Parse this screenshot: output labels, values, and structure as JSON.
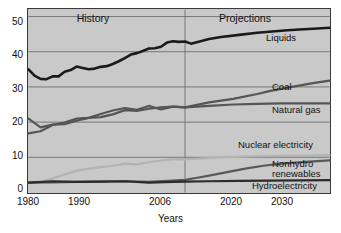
{
  "chart_data": {
    "type": "line",
    "title": "",
    "xlabel": "Years",
    "ylabel": "",
    "xlim": [
      1980,
      2030
    ],
    "ylim": [
      0,
      52
    ],
    "grid": true,
    "legend_position": "right-inline",
    "x_ticks": [
      "1980",
      "1990",
      "2006",
      "2020",
      "2030"
    ],
    "x_tick_values": [
      1980,
      1990,
      2006,
      2020,
      2030
    ],
    "y_ticks": [
      "0",
      "10",
      "20",
      "30",
      "40",
      "50"
    ],
    "y_tick_values": [
      0,
      10,
      20,
      30,
      40,
      50
    ],
    "annotations": [
      {
        "text": "History",
        "x_range": [
          1980,
          2006
        ]
      },
      {
        "text": "Projections",
        "x_range": [
          2006,
          2030
        ]
      },
      {
        "text": "divider",
        "x": 2006
      }
    ],
    "series": [
      {
        "name": "Liquids",
        "color": "#1a1a1a",
        "x": [
          1980,
          1981,
          1982,
          1983,
          1984,
          1985,
          1986,
          1987,
          1988,
          1989,
          1990,
          1991,
          1992,
          1993,
          1994,
          1995,
          1996,
          1997,
          1998,
          1999,
          2000,
          2001,
          2002,
          2003,
          2004,
          2005,
          2006,
          2007,
          2010,
          2012,
          2015,
          2018,
          2020,
          2023,
          2025,
          2028,
          2030
        ],
        "values": [
          35.0,
          33.2,
          32.3,
          32.2,
          33.0,
          33.0,
          34.3,
          34.8,
          35.8,
          35.4,
          35.0,
          35.2,
          35.7,
          35.9,
          36.5,
          37.3,
          38.2,
          39.2,
          39.6,
          40.2,
          40.9,
          41.0,
          41.4,
          42.6,
          43.0,
          42.8,
          42.9,
          42.3,
          43.6,
          44.2,
          44.8,
          45.4,
          45.7,
          46.1,
          46.3,
          46.6,
          46.8
        ]
      },
      {
        "name": "Coal",
        "color": "#555555",
        "x": [
          1980,
          1982,
          1984,
          1986,
          1988,
          1990,
          1992,
          1994,
          1996,
          1998,
          2000,
          2002,
          2004,
          2006,
          2010,
          2014,
          2018,
          2020,
          2024,
          2027,
          2030
        ],
        "values": [
          16.8,
          17.4,
          19.2,
          19.9,
          21.0,
          21.2,
          21.4,
          22.2,
          23.4,
          23.2,
          23.8,
          24.2,
          24.4,
          24.2,
          25.6,
          26.6,
          28.0,
          28.8,
          30.1,
          31.0,
          31.8
        ]
      },
      {
        "name": "Natural gas",
        "color": "#555555",
        "x": [
          1980,
          1982,
          1984,
          1986,
          1988,
          1990,
          1992,
          1994,
          1996,
          1998,
          2000,
          2002,
          2004,
          2006,
          2010,
          2014,
          2018,
          2022,
          2026,
          2030
        ],
        "values": [
          21.0,
          18.5,
          19.3,
          19.4,
          20.4,
          21.2,
          22.3,
          23.3,
          24.0,
          23.5,
          24.6,
          23.6,
          24.4,
          24.2,
          24.6,
          25.0,
          25.2,
          25.3,
          25.3,
          25.3
        ]
      },
      {
        "name": "Nuclear electricity",
        "color": "#b3b3b3",
        "x": [
          1980,
          1982,
          1984,
          1986,
          1988,
          1990,
          1992,
          1994,
          1996,
          1998,
          2000,
          2002,
          2004,
          2006,
          2010,
          2014,
          2018,
          2022,
          2026,
          2030
        ],
        "values": [
          2.7,
          3.0,
          4.0,
          5.1,
          6.2,
          6.8,
          7.2,
          7.6,
          8.2,
          8.0,
          8.6,
          9.1,
          9.4,
          9.4,
          9.8,
          10.1,
          10.3,
          10.4,
          10.5,
          10.6
        ]
      },
      {
        "name": "Nonhydro renewables",
        "color": "#595959",
        "x": [
          1980,
          1984,
          1988,
          1992,
          1996,
          2000,
          2004,
          2006,
          2008,
          2010,
          2013,
          2016,
          2019,
          2022,
          2026,
          2030
        ],
        "values": [
          2.8,
          2.9,
          3.0,
          3.1,
          3.2,
          3.0,
          3.4,
          3.6,
          4.2,
          4.8,
          5.8,
          6.8,
          7.6,
          8.2,
          8.7,
          9.1
        ]
      },
      {
        "name": "Hydroelectricity",
        "color": "#2b2b2b",
        "x": [
          1980,
          1984,
          1988,
          1992,
          1996,
          2000,
          2004,
          2006,
          2010,
          2015,
          2020,
          2025,
          2030
        ],
        "values": [
          2.8,
          3.2,
          3.0,
          3.1,
          3.2,
          2.8,
          3.0,
          3.1,
          3.2,
          3.3,
          3.4,
          3.45,
          3.5
        ]
      }
    ],
    "series_labels": [
      {
        "name": "Liquids",
        "lines": [
          "Liquids"
        ]
      },
      {
        "name": "Coal",
        "lines": [
          "Coal"
        ]
      },
      {
        "name": "Natural gas",
        "lines": [
          "Natural gas"
        ]
      },
      {
        "name": "Nuclear electricity",
        "lines": [
          "Nuclear electricity"
        ]
      },
      {
        "name": "Nonhydro renewables",
        "lines": [
          "Nonhydro",
          "renewables"
        ]
      },
      {
        "name": "Hydroelectricity",
        "lines": [
          "Hydroelectricity"
        ]
      }
    ]
  },
  "labels": {
    "history": "History",
    "projections": "Projections",
    "xaxis_title": "Years",
    "y0": "0",
    "y10": "10",
    "y20": "20",
    "y30": "30",
    "y40": "40",
    "y50": "50",
    "x1980": "1980",
    "x1990": "1990",
    "x2006": "2006",
    "x2020": "2020",
    "x2030": "2030",
    "s_liquids": "Liquids",
    "s_coal": "Coal",
    "s_natural_gas": "Natural gas",
    "s_nuclear": "Nuclear electricity",
    "s_nonhydro1": "Nonhydro",
    "s_nonhydro2": "renewables",
    "s_hydro": "Hydroelectricity"
  },
  "colors": {
    "plot_background": "#c9c9c9",
    "frame": "#3a3a3a",
    "gridline": "#6e6e6e",
    "liquids": "#1a1a1a",
    "coal": "#555555",
    "natural_gas": "#555555",
    "nuclear": "#b3b3b3",
    "nonhydro": "#595959",
    "hydro": "#2b2b2b",
    "text": "#111111"
  }
}
